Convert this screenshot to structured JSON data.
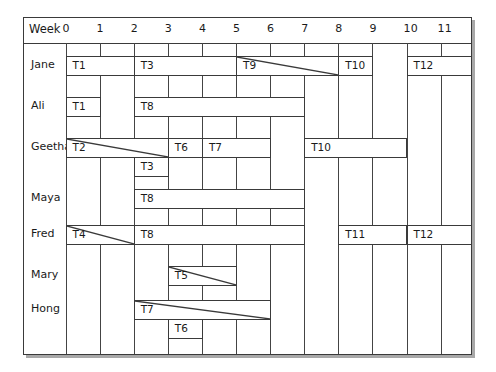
{
  "header": {
    "title": "Week",
    "weeks": [
      "0",
      "1",
      "2",
      "3",
      "4",
      "5",
      "6",
      "7",
      "8",
      "9",
      "10",
      "11"
    ]
  },
  "chart_data": {
    "type": "gantt",
    "title": "",
    "xlabel": "Week",
    "x_ticks": [
      0,
      1,
      2,
      3,
      4,
      5,
      6,
      7,
      8,
      9,
      10,
      11
    ],
    "people": [
      "Jane",
      "Ali",
      "Geetha",
      "Maya",
      "Fred",
      "Mary",
      "Hong"
    ],
    "tasks": [
      {
        "person": "Jane",
        "task": "T1",
        "start": 0,
        "end": 2,
        "lane": 0,
        "diagonal": false
      },
      {
        "person": "Jane",
        "task": "T3",
        "start": 2,
        "end": 5,
        "lane": 0,
        "diagonal": false
      },
      {
        "person": "Jane",
        "task": "T9",
        "start": 5,
        "end": 8,
        "lane": 0,
        "diagonal": true
      },
      {
        "person": "Jane",
        "task": "T10",
        "start": 8,
        "end": 9,
        "lane": 0,
        "diagonal": false
      },
      {
        "person": "Jane",
        "task": "T12",
        "start": 10,
        "end": 12,
        "lane": 0,
        "diagonal": false
      },
      {
        "person": "Ali",
        "task": "T1",
        "start": 0,
        "end": 1,
        "lane": 0,
        "diagonal": false
      },
      {
        "person": "Ali",
        "task": "T8",
        "start": 2,
        "end": 7,
        "lane": 0,
        "diagonal": false
      },
      {
        "person": "Geetha",
        "task": "T2",
        "start": 0,
        "end": 3,
        "lane": 0,
        "diagonal": true
      },
      {
        "person": "Geetha",
        "task": "T6",
        "start": 3,
        "end": 4,
        "lane": 0,
        "diagonal": false
      },
      {
        "person": "Geetha",
        "task": "T7",
        "start": 4,
        "end": 6,
        "lane": 0,
        "diagonal": false
      },
      {
        "person": "Geetha",
        "task": "T10",
        "start": 7,
        "end": 10,
        "lane": 0,
        "diagonal": false
      },
      {
        "person": "Geetha",
        "task": "T3",
        "start": 2,
        "end": 3,
        "lane": 1,
        "diagonal": false
      },
      {
        "person": "Maya",
        "task": "T8",
        "start": 2,
        "end": 7,
        "lane": 0,
        "diagonal": false
      },
      {
        "person": "Fred",
        "task": "T4",
        "start": 0,
        "end": 2,
        "lane": 0,
        "diagonal": true
      },
      {
        "person": "Fred",
        "task": "T8",
        "start": 2,
        "end": 7,
        "lane": 0,
        "diagonal": false
      },
      {
        "person": "Fred",
        "task": "T11",
        "start": 8,
        "end": 10,
        "lane": 0,
        "diagonal": false
      },
      {
        "person": "Fred",
        "task": "T12",
        "start": 10,
        "end": 12,
        "lane": 0,
        "diagonal": false
      },
      {
        "person": "Mary",
        "task": "T5",
        "start": 3,
        "end": 5,
        "lane": 0,
        "diagonal": true
      },
      {
        "person": "Hong",
        "task": "T7",
        "start": 2,
        "end": 6,
        "lane": 0,
        "diagonal": true
      },
      {
        "person": "Hong",
        "task": "T6",
        "start": 3,
        "end": 4,
        "lane": 1,
        "diagonal": false
      }
    ]
  },
  "rows": [
    {
      "name": "Jane",
      "bar_top": 38
    },
    {
      "name": "Ali",
      "bar_top": 79
    },
    {
      "name": "Geetha",
      "bar_top": 120
    },
    {
      "name": "Maya",
      "bar_top": 171
    },
    {
      "name": "Fred",
      "bar_top": 207
    },
    {
      "name": "Mary",
      "bar_top": 248
    },
    {
      "name": "Hong",
      "bar_top": 282
    }
  ],
  "colors": {
    "line": "#3a3a3a",
    "shadow": "#a8a8a8",
    "background": "#ffffff"
  }
}
